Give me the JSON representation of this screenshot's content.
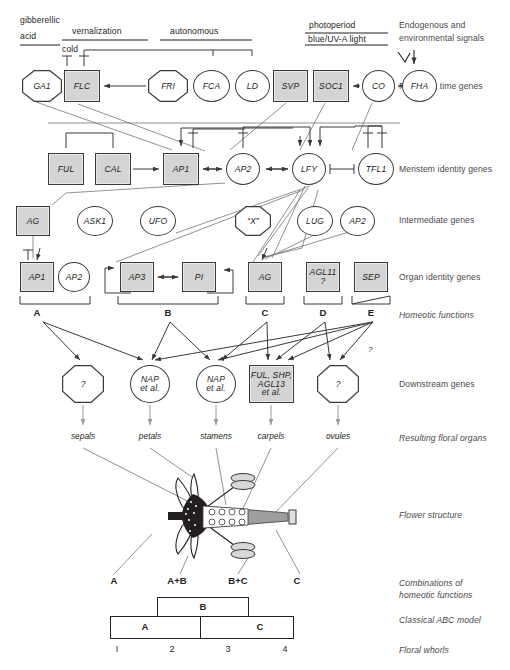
{
  "signals": {
    "gibberellic": "gibberellic",
    "acid": "acid",
    "vernalization": "vernalization",
    "autonomous": "autonomous",
    "photoperiod": "photoperiod",
    "blue_uv": "blue/UV-A light",
    "cold": "cold"
  },
  "row_labels": {
    "signals_l1": "Endogenous and",
    "signals_l2": "environmental signals",
    "flowering_time": "Flowering time genes",
    "meristem": "Meristem identity genes",
    "intermediate": "Intermediate genes",
    "organ_identity": "Organ identity genes",
    "homeotic": "Homeotic functions",
    "downstream": "Downstream genes",
    "floral_organs": "Resulting floral organs",
    "flower_structure": "Flower structure",
    "combinations_l1": "Combinations of",
    "combinations_l2": "homeotic functions",
    "abc_model": "Classical ABC model",
    "floral_whorls": "Floral whorls"
  },
  "flowering_time_genes": [
    {
      "id": "GA1",
      "label": "GA1",
      "shape": "octagon",
      "x": 22,
      "y": 70,
      "w": 40,
      "h": 32
    },
    {
      "id": "FLC",
      "label": "FLC",
      "shape": "square",
      "x": 64,
      "y": 70,
      "w": 36,
      "h": 32
    },
    {
      "id": "FRI",
      "label": "FRI",
      "shape": "octagon",
      "x": 148,
      "y": 70,
      "w": 40,
      "h": 32
    },
    {
      "id": "FCA",
      "label": "FCA",
      "shape": "circle",
      "x": 193,
      "y": 70,
      "w": 37,
      "h": 32
    },
    {
      "id": "LD",
      "label": "LD",
      "shape": "circle",
      "x": 235,
      "y": 70,
      "w": 35,
      "h": 32
    },
    {
      "id": "SVP",
      "label": "SVP",
      "shape": "square",
      "x": 273,
      "y": 70,
      "w": 35,
      "h": 32
    },
    {
      "id": "SOC1",
      "label": "SOC1",
      "shape": "square",
      "x": 313,
      "y": 70,
      "w": 36,
      "h": 32
    },
    {
      "id": "CO",
      "label": "CO",
      "shape": "circle",
      "x": 362,
      "y": 70,
      "w": 33,
      "h": 32
    },
    {
      "id": "FHA",
      "label": "FHA",
      "shape": "circle",
      "x": 402,
      "y": 70,
      "w": 35,
      "h": 32
    }
  ],
  "meristem_genes": [
    {
      "id": "FUL",
      "label": "FUL",
      "shape": "square",
      "x": 48,
      "y": 153,
      "w": 36,
      "h": 32
    },
    {
      "id": "CAL",
      "label": "CAL",
      "shape": "square",
      "x": 95,
      "y": 153,
      "w": 36,
      "h": 32
    },
    {
      "id": "AP1m",
      "label": "AP1",
      "shape": "square",
      "x": 163,
      "y": 153,
      "w": 36,
      "h": 32
    },
    {
      "id": "AP2m",
      "label": "AP2",
      "shape": "circle",
      "x": 226,
      "y": 153,
      "w": 34,
      "h": 32
    },
    {
      "id": "LFY",
      "label": "LFY",
      "shape": "circle",
      "x": 292,
      "y": 153,
      "w": 34,
      "h": 32
    },
    {
      "id": "TFL1",
      "label": "TFL1",
      "shape": "circle",
      "x": 358,
      "y": 153,
      "w": 36,
      "h": 32
    }
  ],
  "intermediate_genes": [
    {
      "id": "AGi",
      "label": "AG",
      "shape": "square",
      "x": 16,
      "y": 206,
      "w": 34,
      "h": 30
    },
    {
      "id": "ASK1",
      "label": "ASK1",
      "shape": "circle",
      "x": 77,
      "y": 206,
      "w": 36,
      "h": 30
    },
    {
      "id": "UFO",
      "label": "UFO",
      "shape": "circle",
      "x": 140,
      "y": 206,
      "w": 36,
      "h": 30
    },
    {
      "id": "X",
      "label": "“X”",
      "shape": "octagon",
      "x": 235,
      "y": 206,
      "w": 36,
      "h": 30
    },
    {
      "id": "LUG",
      "label": "LUG",
      "shape": "circle",
      "x": 297,
      "y": 206,
      "w": 36,
      "h": 30
    },
    {
      "id": "AP2i",
      "label": "AP2",
      "shape": "circle",
      "x": 340,
      "y": 206,
      "w": 35,
      "h": 30
    }
  ],
  "organ_identity_genes": [
    {
      "id": "AP1o",
      "label": "AP1",
      "shape": "square",
      "x": 20,
      "y": 262,
      "w": 34,
      "h": 30
    },
    {
      "id": "AP2o",
      "label": "AP2",
      "shape": "circle",
      "x": 58,
      "y": 262,
      "w": 32,
      "h": 30
    },
    {
      "id": "AP3",
      "label": "AP3",
      "shape": "square",
      "x": 120,
      "y": 262,
      "w": 34,
      "h": 30
    },
    {
      "id": "PI",
      "label": "PI",
      "shape": "square",
      "x": 182,
      "y": 262,
      "w": 34,
      "h": 30
    },
    {
      "id": "AGo",
      "label": "AG",
      "shape": "square",
      "x": 248,
      "y": 262,
      "w": 34,
      "h": 30
    },
    {
      "id": "AGL11",
      "label": "AGL11\n?",
      "shape": "square",
      "x": 306,
      "y": 262,
      "w": 34,
      "h": 30
    },
    {
      "id": "SEP",
      "label": "SEP",
      "shape": "square",
      "x": 354,
      "y": 262,
      "w": 34,
      "h": 30
    }
  ],
  "homeotic_functions": [
    {
      "label": "A",
      "x": 37,
      "bx": 20,
      "bw": 70
    },
    {
      "label": "B",
      "x": 168,
      "bx": 118,
      "bw": 100
    },
    {
      "label": "C",
      "x": 265,
      "bx": 246,
      "bw": 38
    },
    {
      "label": "D",
      "x": 323,
      "bx": 304,
      "bw": 38
    },
    {
      "label": "E",
      "x": 371,
      "bx": 352,
      "bw": 38
    }
  ],
  "downstream_genes": [
    {
      "id": "d1",
      "label": "?",
      "shape": "octagon",
      "x": 62,
      "y": 365,
      "w": 42,
      "h": 38
    },
    {
      "id": "d2",
      "label": "NAP\net al.",
      "shape": "circle",
      "x": 130,
      "y": 365,
      "w": 40,
      "h": 38
    },
    {
      "id": "d3",
      "label": "NAP\net al.",
      "shape": "circle",
      "x": 196,
      "y": 365,
      "w": 40,
      "h": 38
    },
    {
      "id": "d4",
      "label": "FUL, SHP,\nAGL13\net al.",
      "shape": "square",
      "x": 249,
      "y": 365,
      "w": 45,
      "h": 38
    },
    {
      "id": "d5",
      "label": "?",
      "shape": "octagon",
      "x": 317,
      "y": 365,
      "w": 42,
      "h": 38
    }
  ],
  "floral_organs": [
    {
      "label": "sepals",
      "x": 83
    },
    {
      "label": "petals",
      "x": 150
    },
    {
      "label": "stamens",
      "x": 216
    },
    {
      "label": "carpels",
      "x": 271
    },
    {
      "label": "ovules",
      "x": 338
    }
  ],
  "combinations": [
    {
      "label": "A",
      "x": 114
    },
    {
      "label": "A+B",
      "x": 177
    },
    {
      "label": "B+C",
      "x": 238
    },
    {
      "label": "C",
      "x": 297
    }
  ],
  "abc_model": {
    "B_label": "B",
    "A_label": "A",
    "C_label": "C"
  },
  "whorls": [
    {
      "label": "I",
      "x": 117
    },
    {
      "label": "2",
      "x": 172
    },
    {
      "label": "3",
      "x": 228
    },
    {
      "label": "4",
      "x": 285
    }
  ],
  "annotations": {
    "e_question": "?"
  },
  "colors": {
    "node_fill_gray": "#d4d4d4",
    "stroke": "#3a3a3a",
    "text": "#231f20",
    "gray_arrow": "#9a9a9a"
  }
}
